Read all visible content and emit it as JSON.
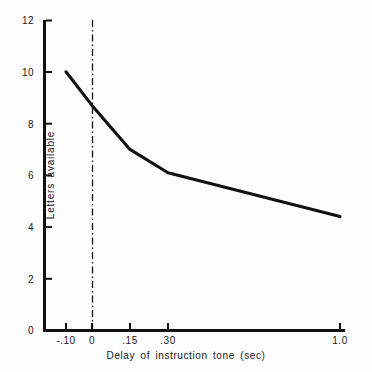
{
  "chart_data": {
    "type": "line",
    "title": "",
    "xlabel": "Delay of instruction tone  (sec)",
    "ylabel": "Letters available",
    "x_tick_labels": [
      "-.10",
      "0",
      ".15",
      ".30",
      "1.0"
    ],
    "x_tick_positions": [
      66,
      92,
      130,
      168,
      340
    ],
    "x_values": [
      -0.1,
      0,
      0.15,
      0.3,
      1.0
    ],
    "y_tick_labels": [
      "0",
      "2",
      "4",
      "6",
      "8",
      "10",
      "12"
    ],
    "y_tick_values": [
      0,
      2,
      4,
      6,
      8,
      10,
      12
    ],
    "ylim": [
      0,
      12
    ],
    "grid": false,
    "legend": null,
    "series": [
      {
        "name": "Letters available",
        "values": [
          10.0,
          8.7,
          7.0,
          6.1,
          4.4
        ]
      }
    ],
    "annotations": [
      {
        "type": "vertical-reference-line",
        "style": "dash-dot",
        "x_value": 0,
        "x_position": 92,
        "label": "0"
      }
    ],
    "line_color": "#111111",
    "axis_color": "#111111",
    "background_color": "#fefefe"
  }
}
